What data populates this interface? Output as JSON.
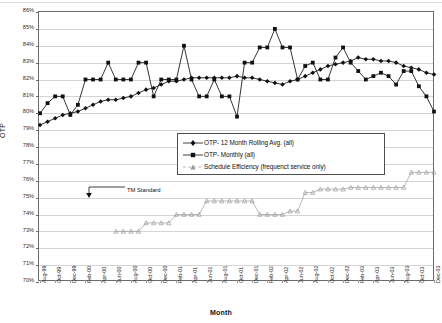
{
  "chart_data": {
    "type": "line",
    "title": "",
    "xlabel": "Month",
    "ylabel": "OTP",
    "ylim": [
      70,
      86
    ],
    "ytick_step": 1,
    "ytick_labels": [
      "86%",
      "85%",
      "84%",
      "83%",
      "82%",
      "81%",
      "80%",
      "79%",
      "78%",
      "77%",
      "76%",
      "75%",
      "74%",
      "73%",
      "72%",
      "71%",
      "70%"
    ],
    "grid": true,
    "legend_position": "center",
    "categories": [
      "Aug-99",
      "Sep-99",
      "Oct-99",
      "Nov-99",
      "Dec-99",
      "Jan-00",
      "Feb-00",
      "Mar-00",
      "Apr-00",
      "May-00",
      "Jun-00",
      "Jul-00",
      "Aug-00",
      "Sep-00",
      "Oct-00",
      "Nov-00",
      "Dec-00",
      "Jan-01",
      "Feb-01",
      "Mar-01",
      "Apr-01",
      "May-01",
      "Jun-01",
      "Jul-01",
      "Aug-01",
      "Sep-01",
      "Oct-01",
      "Nov-01",
      "Dec-01",
      "Jan-02",
      "Feb-02",
      "Mar-02",
      "Apr-02",
      "May-02",
      "Jun-02",
      "Jul-02",
      "Aug-02",
      "Sep-02",
      "Oct-02",
      "Nov-02",
      "Dec-02",
      "Jan-03",
      "Feb-03",
      "Mar-03",
      "Apr-03",
      "May-03",
      "Jun-03",
      "Jul-03",
      "Aug-03",
      "Sep-03",
      "Oct-03",
      "Nov-03",
      "Dec-03"
    ],
    "xtick_labels": [
      "Aug-99",
      "Oct-99",
      "Dec-99",
      "Feb-00",
      "Apr-00",
      "Jun-00",
      "Aug-00",
      "Oct-00",
      "Dec-00",
      "Feb-01",
      "Apr-01",
      "Jun-01",
      "Aug-01",
      "Oct-01",
      "Dec-01",
      "Feb-02",
      "Apr-02",
      "Jun-02",
      "Aug-02",
      "Oct-02",
      "Dec-02",
      "Feb-03",
      "Apr-03",
      "Jun-03",
      "Aug-03",
      "Oct-03",
      "Dec-03"
    ],
    "series": [
      {
        "name": "OTP- 12 Month Rolling Avg. (all)",
        "marker": "diamond",
        "color": "#111111",
        "values": [
          79.3,
          79.5,
          79.7,
          79.9,
          80.0,
          80.1,
          80.3,
          80.5,
          80.7,
          80.8,
          80.8,
          80.9,
          81.0,
          81.2,
          81.4,
          81.5,
          81.7,
          81.9,
          81.9,
          82.0,
          82.1,
          82.1,
          82.1,
          82.1,
          82.1,
          82.1,
          82.2,
          82.1,
          82.1,
          82.0,
          81.9,
          81.8,
          81.7,
          81.9,
          82.0,
          82.2,
          82.4,
          82.6,
          82.8,
          82.9,
          83.0,
          83.1,
          83.3,
          83.2,
          83.2,
          83.1,
          83.1,
          83.0,
          82.8,
          82.7,
          82.6,
          82.4,
          82.3
        ]
      },
      {
        "name": "OTP-  Monthly (all)",
        "marker": "square",
        "color": "#111111",
        "values": [
          80.0,
          80.6,
          81.0,
          81.0,
          79.9,
          80.5,
          82.0,
          82.0,
          82.0,
          83.0,
          82.0,
          82.0,
          82.0,
          83.0,
          83.0,
          81.0,
          82.0,
          82.0,
          82.0,
          84.0,
          82.0,
          81.0,
          81.0,
          82.0,
          81.0,
          81.0,
          79.8,
          83.0,
          83.0,
          83.9,
          83.9,
          85.0,
          83.9,
          83.9,
          82.0,
          82.8,
          83.0,
          82.0,
          82.0,
          83.3,
          83.9,
          83.0,
          82.5,
          82.0,
          82.2,
          82.4,
          82.2,
          81.7,
          82.5,
          82.5,
          81.6,
          81.0,
          80.1
        ]
      },
      {
        "name": "Schedule Efficiency (frequenct service only)",
        "marker": "triangle",
        "color": "#9a9a9a",
        "start_index": 10,
        "values": [
          null,
          null,
          null,
          null,
          null,
          null,
          null,
          null,
          null,
          null,
          73.0,
          73.0,
          73.0,
          73.0,
          73.5,
          73.5,
          73.5,
          73.5,
          74.0,
          74.0,
          74.0,
          74.0,
          74.8,
          74.8,
          74.8,
          74.8,
          74.8,
          74.8,
          74.8,
          74.0,
          74.0,
          74.0,
          74.0,
          74.2,
          74.2,
          75.3,
          75.3,
          75.5,
          75.5,
          75.5,
          75.5,
          75.6,
          75.6,
          75.6,
          75.6,
          75.6,
          75.6,
          75.6,
          75.6,
          76.5,
          76.5,
          76.5,
          76.5
        ]
      }
    ],
    "annotations": [
      {
        "label": "TM Standard",
        "value": 75.0,
        "at_index": 0
      }
    ]
  },
  "legend": {
    "items": [
      {
        "label": "OTP- 12 Month Rolling Avg. (all)",
        "marker": "diamond"
      },
      {
        "label": "OTP-  Monthly (all)",
        "marker": "square"
      },
      {
        "label": "Schedule Efficiency (frequenct service only)",
        "marker": "triangle"
      }
    ]
  }
}
